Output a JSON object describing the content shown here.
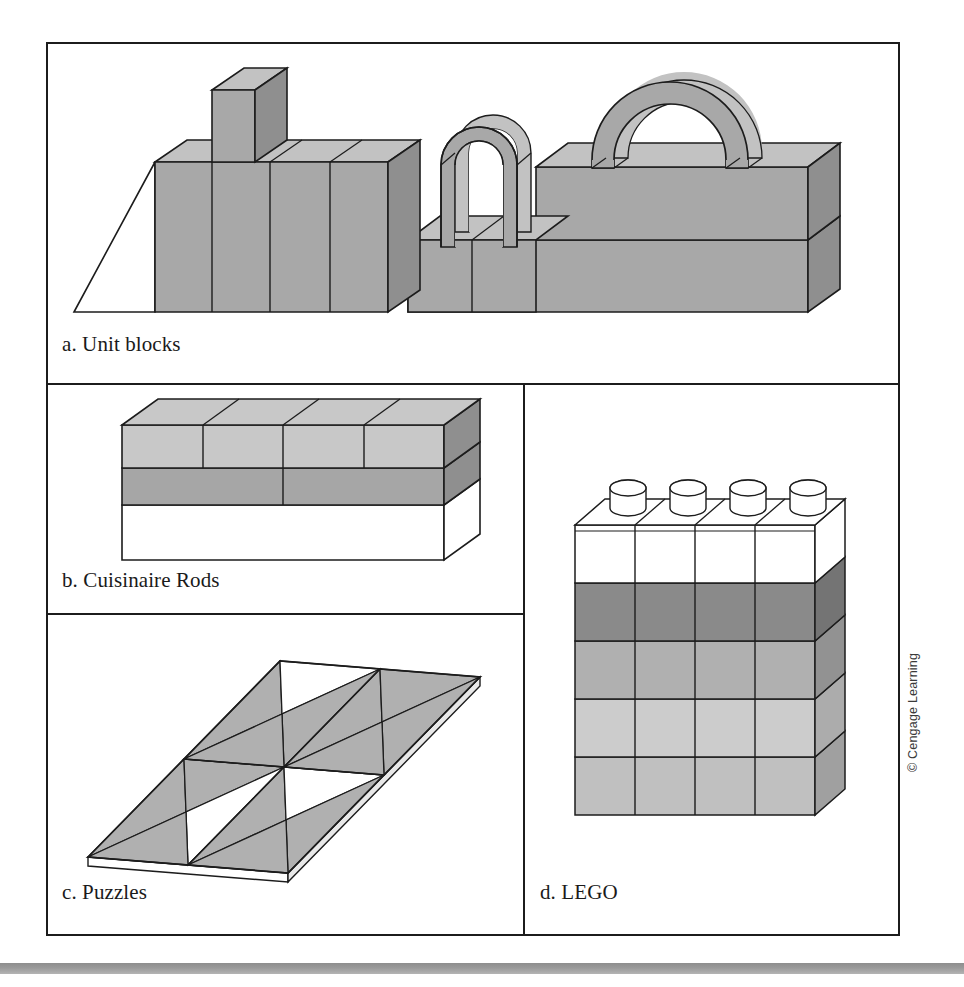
{
  "figure": {
    "panels": [
      {
        "key": "a",
        "label": "a. Unit blocks",
        "name": "panel-a-unit-blocks"
      },
      {
        "key": "b",
        "label": "b. Cuisinaire Rods",
        "name": "panel-b-cuisinaire-rods"
      },
      {
        "key": "c",
        "label": "c. Puzzles",
        "name": "panel-c-puzzles"
      },
      {
        "key": "d",
        "label": "d. LEGO",
        "name": "panel-d-lego"
      }
    ],
    "credit": "© Cengage Learning"
  },
  "colors": {
    "outline": "#1c1c1c",
    "face_front": "#a8a8a8",
    "face_top": "#c2c2c2",
    "face_side": "#8f8f8f",
    "light_gray": "#c8c8c8",
    "mid_gray": "#a6a6a6",
    "dark_gray": "#8a8a8a",
    "white": "#ffffff",
    "bottom_bar": "#9a9a9a",
    "background": "#ffffff"
  },
  "panel_a": {
    "description": "Row of wooden unit blocks with a ramp, a tall rectangular block, four upright rectangular blocks, a small semicircular arch and a large semicircular arch resting on a two-layer rectangular base.",
    "elements": [
      {
        "name": "ramp-wedge",
        "shape": "triangle"
      },
      {
        "name": "tall-column-block",
        "shape": "box"
      },
      {
        "name": "upright-block-1",
        "shape": "box"
      },
      {
        "name": "upright-block-2",
        "shape": "box"
      },
      {
        "name": "upright-block-3",
        "shape": "box"
      },
      {
        "name": "upright-block-4",
        "shape": "box"
      },
      {
        "name": "small-arch",
        "shape": "arch"
      },
      {
        "name": "large-arch",
        "shape": "arch"
      },
      {
        "name": "base-slab-upper",
        "shape": "box"
      },
      {
        "name": "base-slab-lower",
        "shape": "box"
      }
    ]
  },
  "panel_b": {
    "description": "Three stacked Cuisinaire rod layers seen in isometric view.",
    "layers": [
      {
        "name": "top-layer",
        "segments": 4,
        "fill": "#c8c8c8"
      },
      {
        "name": "middle-layer",
        "segments": 2,
        "fill": "#a6a6a6"
      },
      {
        "name": "bottom-layer",
        "segments": 1,
        "fill": "#ffffff"
      }
    ]
  },
  "panel_c": {
    "description": "Flat puzzle board drawn in perspective as a parallelogram, tiled with shaded and unshaded triangular pieces.",
    "grid_columns": 2,
    "grid_rows": 2,
    "pieces_per_cell": 4,
    "shaded_fill": "#b0b0b0",
    "unshaded_fill": "#ffffff"
  },
  "panel_d": {
    "description": "Stack of LEGO bricks, four studs wide and five bricks tall, shown in isometric view.",
    "columns": 4,
    "rows": 5,
    "studs": 4,
    "row_fills": [
      "#ffffff",
      "#8a8a8a",
      "#b0b0b0",
      "#cccccc",
      "#c0c0c0"
    ]
  }
}
